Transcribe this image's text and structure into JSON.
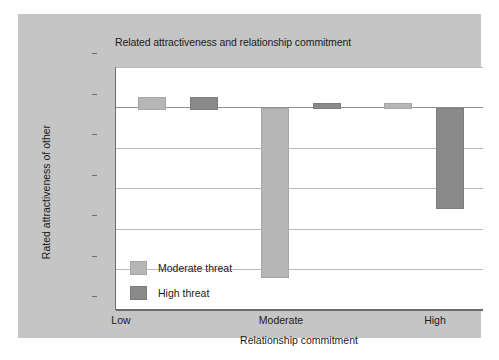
{
  "chart_data": {
    "type": "bar",
    "title": "Related attractiveness and relationship commitment",
    "xlabel": "Relationship commitment",
    "ylabel": "Rated attractiveness of other",
    "categories": [
      "Low",
      "Moderate",
      "High"
    ],
    "series": [
      {
        "name": "Moderate threat",
        "color": "#b6b6b6",
        "values": [
          0.05,
          -0.83,
          0.02
        ]
      },
      {
        "name": "High threat",
        "color": "#8a8a8a",
        "values": [
          0.05,
          0.02,
          -0.49
        ]
      }
    ],
    "ylim": [
      -1,
      0.2
    ],
    "ytick_labels": [
      "0.2",
      "0",
      "−0.2",
      "−0.4",
      "−0.6",
      "−0.8",
      "−1"
    ],
    "ytick_values": [
      0.2,
      0,
      -0.2,
      -0.4,
      -0.6,
      -0.8,
      -1
    ],
    "grid": true,
    "legend_position": "inside-lower-left",
    "panel_color": "#c5c5c5",
    "plot_background": "#ffffff"
  }
}
